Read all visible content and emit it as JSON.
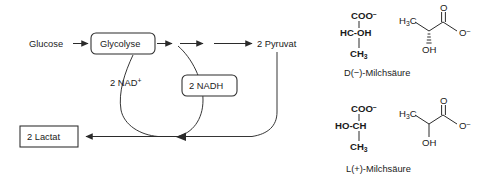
{
  "figure": {
    "background_color": "#ffffff",
    "line_color": "#2b2b2b",
    "text_color": "#1a1a1a"
  },
  "pathway": {
    "substrate_label": "Glucose",
    "process_box_label": "Glycolyse",
    "product_label": "2 Pyruvat",
    "end_product_box_label": "2 Lactat",
    "cofactor_oxidized": "2 NAD",
    "cofactor_oxidized_charge": "+",
    "cofactor_reduced_box_label": "2 NADH"
  },
  "structures": {
    "d_form": {
      "caption": "D(−)-Milchsäure",
      "fischer": {
        "top_group": "COO",
        "top_charge": "–",
        "center_left": "HC",
        "center_bond": "-",
        "center_right": "OH",
        "bottom_group": "CH",
        "bottom_subscript": "3"
      },
      "skeletal": {
        "methyl_label": "H",
        "methyl_subscript": "3",
        "methyl_label_tail": "C",
        "carbonyl_oxygen": "O",
        "carboxylate_oxygen": "O",
        "carboxylate_charge": "–",
        "hydroxyl": "OH",
        "stereo_bond": "hashed-wedge"
      }
    },
    "l_form": {
      "caption": "L(+)-Milchsäure",
      "fischer": {
        "top_group": "COO",
        "top_charge": "–",
        "center_left": "HO",
        "center_bond": "-",
        "center_right": "CH",
        "bottom_group": "CH",
        "bottom_subscript": "3"
      },
      "skeletal": {
        "methyl_label": "H",
        "methyl_subscript": "3",
        "methyl_label_tail": "C",
        "carbonyl_oxygen": "O",
        "carboxylate_oxygen": "O",
        "carboxylate_charge": "–",
        "hydroxyl": "OH",
        "stereo_bond": "plain"
      }
    }
  }
}
